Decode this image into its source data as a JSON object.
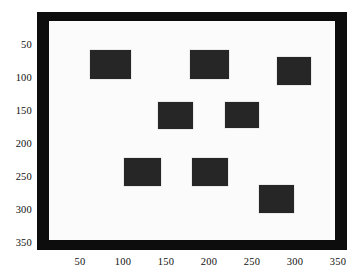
{
  "figure": {
    "title": "",
    "background_color": "#ffffff",
    "axes_border_color": "#0d0d0d",
    "image_background_color": "#fbfbfb",
    "blob_color": "#262626"
  },
  "axes": {
    "x_ticks": [
      "50",
      "100",
      "150",
      "200",
      "250",
      "300",
      "350"
    ],
    "y_ticks": [
      "50",
      "100",
      "150",
      "200",
      "250",
      "300",
      "350"
    ],
    "xlabel": "",
    "ylabel": ""
  },
  "chart_data": {
    "type": "scatter",
    "title": "",
    "xlabel": "",
    "ylabel": "",
    "xlim": [
      0,
      360
    ],
    "ylim": [
      360,
      0
    ],
    "grid": false,
    "legend": null,
    "x_tick_values": [
      50,
      100,
      150,
      200,
      250,
      300,
      350
    ],
    "y_tick_values": [
      50,
      100,
      150,
      200,
      250,
      300,
      350
    ],
    "frame": {
      "x0": 0,
      "y0": 0,
      "x1": 360,
      "y1": 360,
      "border_thickness": 14
    },
    "blobs": [
      {
        "id": 1,
        "x0": 62,
        "y0": 58,
        "x1": 109,
        "y1": 102,
        "cx": 85.5,
        "cy": 80.0,
        "width": 47,
        "height": 44
      },
      {
        "id": 2,
        "x0": 178,
        "y0": 58,
        "x1": 223,
        "y1": 102,
        "cx": 200.5,
        "cy": 80.0,
        "width": 45,
        "height": 44
      },
      {
        "id": 3,
        "x0": 279,
        "y0": 68,
        "x1": 319,
        "y1": 111,
        "cx": 299.0,
        "cy": 89.5,
        "width": 40,
        "height": 43
      },
      {
        "id": 4,
        "x0": 141,
        "y0": 136,
        "x1": 181,
        "y1": 177,
        "cx": 161.0,
        "cy": 156.5,
        "width": 40,
        "height": 41
      },
      {
        "id": 5,
        "x0": 219,
        "y0": 136,
        "x1": 258,
        "y1": 176,
        "cx": 238.5,
        "cy": 156.0,
        "width": 39,
        "height": 40
      },
      {
        "id": 6,
        "x0": 101,
        "y0": 221,
        "x1": 144,
        "y1": 264,
        "cx": 122.5,
        "cy": 242.5,
        "width": 43,
        "height": 43
      },
      {
        "id": 7,
        "x0": 180,
        "y0": 221,
        "x1": 222,
        "y1": 264,
        "cx": 201.0,
        "cy": 242.5,
        "width": 42,
        "height": 43
      },
      {
        "id": 8,
        "x0": 258,
        "y0": 262,
        "x1": 299,
        "y1": 305,
        "cx": 278.5,
        "cy": 283.5,
        "width": 41,
        "height": 43
      }
    ]
  }
}
